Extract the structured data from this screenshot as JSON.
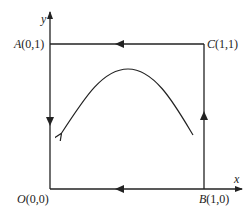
{
  "diagram": {
    "axes": {
      "x_label": "x",
      "y_label": "y"
    },
    "points": {
      "O": {
        "name": "O",
        "coords": "(0,0)"
      },
      "A": {
        "name": "A",
        "coords": "(0,1)"
      },
      "B": {
        "name": "B",
        "coords": "(1,0)"
      },
      "C": {
        "name": "C",
        "coords": "(1,1)"
      }
    },
    "path_direction": [
      "B → C (up)",
      "C → A (left)",
      "A → O (down)",
      "O ← B (bottom, pointing left)"
    ],
    "curve": "arc from lower right rising to a peak then descending to lower left, arrow pointing down-left",
    "colors": {
      "stroke": "#222222",
      "background": "#ffffff"
    }
  }
}
